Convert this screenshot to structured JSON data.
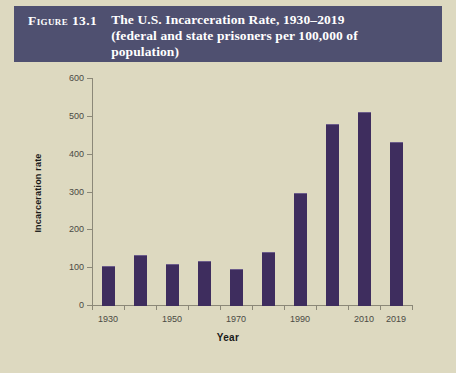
{
  "header": {
    "figure_number": "Figure 13.1",
    "title_line1": "The U.S. Incarceration Rate, 1930–2019",
    "title_line2": "(federal and state prisoners per 100,000 of",
    "title_line3": "population)",
    "title_full": "The U.S. Incarceration Rate, 1930–2019 (federal and state prisoners per 100,000 of population)",
    "banner_color": "#4f5070",
    "text_color": "#ffffff"
  },
  "figure": {
    "background_color": "#ddd9c0",
    "bar_color": "#3e2d5e",
    "axis_color": "#8b8878",
    "tick_text_color": "#4a4a44"
  },
  "chart_data": {
    "type": "bar",
    "title": "The U.S. Incarceration Rate, 1930–2019 (federal and state prisoners per 100,000 of population)",
    "xlabel": "Year",
    "ylabel": "Incarceration rate",
    "categories": [
      "1930",
      "1940",
      "1950",
      "1960",
      "1970",
      "1980",
      "1990",
      "2000",
      "2010",
      "2019"
    ],
    "values": [
      104,
      131,
      109,
      117,
      96,
      139,
      297,
      478,
      510,
      432
    ],
    "x_tick_labels": [
      "1930",
      "1950",
      "1970",
      "1990",
      "2010",
      "2019"
    ],
    "y_tick_labels": [
      "0",
      "100",
      "200",
      "300",
      "400",
      "500",
      "600"
    ],
    "y_ticks": [
      0,
      100,
      200,
      300,
      400,
      500,
      600
    ],
    "ylim": [
      0,
      600
    ],
    "grid": false,
    "legend": "none",
    "series": [
      {
        "name": "Incarceration rate",
        "values": [
          104,
          131,
          109,
          117,
          96,
          139,
          297,
          478,
          510,
          432
        ]
      }
    ]
  }
}
